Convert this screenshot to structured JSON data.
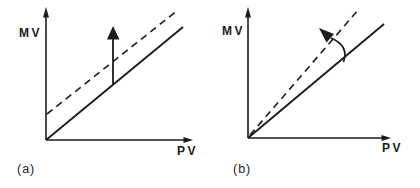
{
  "figure": {
    "background_color": "#ffffff",
    "ink_color": "#1c1c1c"
  },
  "panels": [
    {
      "caption": "(a)",
      "y_axis_label": "MV",
      "x_axis_label": "PV"
    },
    {
      "caption": "(b)",
      "y_axis_label": "MV",
      "x_axis_label": "PV"
    }
  ]
}
